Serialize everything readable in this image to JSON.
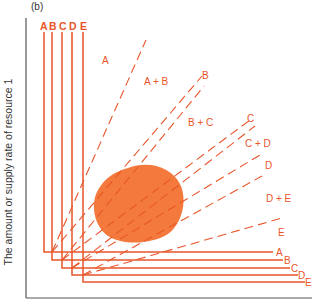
{
  "figure": {
    "panel_label": "(b)",
    "y_axis_label": "The amount or supply rate of resource 1",
    "x_axis_label": "",
    "colors": {
      "accent": "#e8562a",
      "blob": "#f37a3c",
      "axis": "#555555"
    },
    "top_species_labels": [
      "A",
      "B",
      "C",
      "D",
      "E"
    ],
    "right_species_labels": [
      "A",
      "B",
      "C",
      "D",
      "E"
    ],
    "region_labels": [
      "A",
      "A + B",
      "B + C",
      "C + D",
      "D + E",
      "E"
    ],
    "ray_end_labels": [
      "B",
      "C",
      "D"
    ]
  }
}
